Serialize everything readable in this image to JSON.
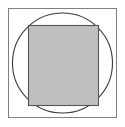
{
  "canvas": {
    "width": 125,
    "height": 127,
    "background_color": "#ffffff",
    "title": "Square with inscribed circle and filled inner square"
  },
  "colors": {
    "background": "#ffffff",
    "outer_square_stroke": "#808080",
    "circle_stroke": "#3a3a3a",
    "inner_square_fill": "#bfbfbf",
    "inner_square_stroke": "#555555"
  },
  "shapes": {
    "outer_square": {
      "name": "outer-square",
      "x": 8.5,
      "y": 8.5,
      "width": 108,
      "height": 109,
      "fill": "none",
      "stroke": "#808080",
      "stroke_width": 1
    },
    "circle": {
      "name": "inscribed-circle",
      "cx": 62.5,
      "cy": 63,
      "r": 50,
      "fill": "none",
      "stroke": "#3a3a3a",
      "stroke_width": 1.1
    },
    "inner_square": {
      "name": "inner-filled-square",
      "x": 28.5,
      "y": 25.5,
      "width": 70,
      "height": 80,
      "fill": "#bfbfbf",
      "stroke": "#555555",
      "stroke_width": 1.1
    }
  }
}
